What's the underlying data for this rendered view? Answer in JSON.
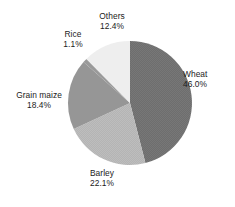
{
  "chart_data": {
    "type": "pie",
    "title": "",
    "subtitle": "",
    "xlabel": "",
    "ylabel": "",
    "legend_position": "none",
    "grid": false,
    "value_unit": "%",
    "start_angle_deg": 0,
    "direction": "clockwise",
    "categories": [
      "Wheat",
      "Barley",
      "Grain maize",
      "Rice",
      "Others"
    ],
    "values": [
      46.0,
      22.1,
      18.4,
      1.1,
      12.4
    ],
    "slices": [
      {
        "label": "Wheat",
        "percent_text": "46.0%",
        "value": 46.0,
        "color": "#6e6e6e",
        "pattern": "fine-checker",
        "start_deg": 0,
        "end_deg": 165.6
      },
      {
        "label": "Barley",
        "percent_text": "22.1%",
        "value": 22.1,
        "color": "#b4b4b4",
        "pattern": "fine-checker",
        "start_deg": 165.6,
        "end_deg": 245.2
      },
      {
        "label": "Grain maize",
        "percent_text": "18.4%",
        "value": 18.4,
        "color": "#969696",
        "pattern": "solid",
        "start_deg": 245.2,
        "end_deg": 311.4
      },
      {
        "label": "Rice",
        "percent_text": "1.1%",
        "value": 1.1,
        "color": "#9a9a9a",
        "pattern": "solid",
        "start_deg": 311.4,
        "end_deg": 315.4
      },
      {
        "label": "Others",
        "percent_text": "12.4%",
        "value": 12.4,
        "color": "#eeeeee",
        "pattern": "solid",
        "start_deg": 315.4,
        "end_deg": 360.0
      }
    ],
    "colors": {
      "background": "#ffffff",
      "text": "#1b1b1b",
      "wheat": "#6e6e6e",
      "barley": "#b4b4b4",
      "grain_maize": "#969696",
      "rice": "#9a9a9a",
      "others": "#eeeeee"
    }
  },
  "labels": {
    "others": {
      "name": "Others",
      "percent": "12.4%"
    },
    "rice": {
      "name": "Rice",
      "percent": "1.1%"
    },
    "wheat": {
      "name": "Wheat",
      "percent": "46.0%"
    },
    "grain_maize": {
      "name": "Grain maize",
      "percent": "18.4%"
    },
    "barley": {
      "name": "Barley",
      "percent": "22.1%"
    }
  }
}
